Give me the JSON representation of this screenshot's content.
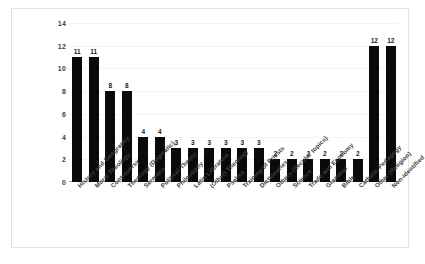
{
  "chart_data": {
    "type": "bar",
    "title": "",
    "xlabel": "",
    "ylabel": "",
    "ylim": [
      0,
      14
    ],
    "y_ticks": [
      0,
      2,
      4,
      6,
      8,
      10,
      12,
      14
    ],
    "grid": true,
    "legend": "none",
    "bar_color": "#0a0a0a",
    "categories": [
      "History and Geography",
      "Moral Theology",
      "Controversy",
      "Theology (Dogmatic)",
      "Sermons",
      "Political Theory",
      "Philosophy",
      "Latin Literature",
      "(Other) Theology",
      "Psalms",
      "Training of Priests",
      "Dictionaries",
      "Others (Secular topics)",
      "Science",
      "Trade and Economy",
      "Grammar",
      "Bible",
      "Catholic Pedagogy",
      "Other (Religion)",
      "Non-identified"
    ],
    "values": [
      11,
      11,
      8,
      8,
      4,
      4,
      3,
      3,
      3,
      3,
      3,
      3,
      2,
      2,
      2,
      2,
      2,
      2,
      12,
      12
    ],
    "data_labels": [
      "11",
      "11",
      "8",
      "8",
      "4",
      "4",
      "3",
      "3",
      "3",
      "3",
      "3",
      "3",
      "2",
      "2",
      "2",
      "2",
      "2",
      "2",
      "12",
      "12"
    ]
  },
  "frame": {
    "border_color": "#e2e2e2",
    "background": "#ffffff"
  }
}
